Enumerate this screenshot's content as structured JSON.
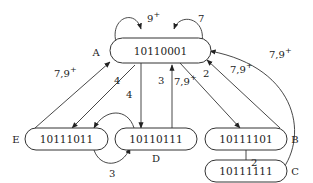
{
  "diagram": {
    "type": "state-transition",
    "nodes": [
      {
        "id": "A",
        "name": "A",
        "label": "10110001"
      },
      {
        "id": "B",
        "name": "B",
        "label": "10111101"
      },
      {
        "id": "C",
        "name": "C",
        "label": "10111111"
      },
      {
        "id": "D",
        "name": "D",
        "label": "10110111"
      },
      {
        "id": "E",
        "name": "E",
        "label": "10111011"
      }
    ],
    "edges": [
      {
        "from": "A",
        "to": "A",
        "label": "9+",
        "label_base": "9",
        "label_sup": "+"
      },
      {
        "from": "A",
        "to": "A",
        "label": "7",
        "label_base": "7",
        "label_sup": ""
      },
      {
        "from": "E",
        "to": "A",
        "label": "7,9+",
        "label_base": "7,9",
        "label_sup": "+"
      },
      {
        "from": "A",
        "to": "E",
        "label": "4",
        "label_base": "4",
        "label_sup": ""
      },
      {
        "from": "D",
        "to": "E",
        "label": "4",
        "label_base": "4",
        "label_sup": ""
      },
      {
        "from": "E",
        "to": "D",
        "label": "3",
        "label_base": "3",
        "label_sup": ""
      },
      {
        "from": "A",
        "to": "D",
        "label": "3",
        "label_base": "3",
        "label_sup": ""
      },
      {
        "from": "D",
        "to": "A",
        "label": "7,9+",
        "label_base": "7,9",
        "label_sup": "+"
      },
      {
        "from": "A",
        "to": "B",
        "label": "2",
        "label_base": "2",
        "label_sup": ""
      },
      {
        "from": "B",
        "to": "A",
        "label": "7,9+",
        "label_base": "7,9",
        "label_sup": "+"
      },
      {
        "from": "B",
        "to": "C",
        "label": "2",
        "label_base": "2",
        "label_sup": ""
      },
      {
        "from": "C",
        "to": "A",
        "label": "7,9+",
        "label_base": "7,9",
        "label_sup": "+"
      }
    ]
  }
}
